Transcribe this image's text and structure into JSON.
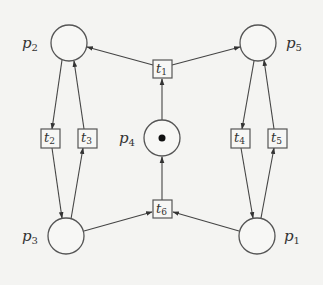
{
  "diagram": {
    "type": "petri-net",
    "places": [
      {
        "id": "p1",
        "name": "p",
        "sub": "1",
        "tokens": 0
      },
      {
        "id": "p2",
        "name": "p",
        "sub": "2",
        "tokens": 0
      },
      {
        "id": "p3",
        "name": "p",
        "sub": "3",
        "tokens": 0
      },
      {
        "id": "p4",
        "name": "p",
        "sub": "4",
        "tokens": 1
      },
      {
        "id": "p5",
        "name": "p",
        "sub": "5",
        "tokens": 0
      }
    ],
    "transitions": [
      {
        "id": "t1",
        "name": "t",
        "sub": "1"
      },
      {
        "id": "t2",
        "name": "t",
        "sub": "2"
      },
      {
        "id": "t3",
        "name": "t",
        "sub": "3"
      },
      {
        "id": "t4",
        "name": "t",
        "sub": "4"
      },
      {
        "id": "t5",
        "name": "t",
        "sub": "5"
      },
      {
        "id": "t6",
        "name": "t",
        "sub": "6"
      }
    ],
    "arcs": [
      {
        "from": "p4",
        "to": "t1"
      },
      {
        "from": "t1",
        "to": "p2"
      },
      {
        "from": "t1",
        "to": "p5"
      },
      {
        "from": "p2",
        "to": "t2"
      },
      {
        "from": "t2",
        "to": "p3"
      },
      {
        "from": "p3",
        "to": "t3"
      },
      {
        "from": "t3",
        "to": "p2"
      },
      {
        "from": "p5",
        "to": "t4"
      },
      {
        "from": "t4",
        "to": "p1"
      },
      {
        "from": "p1",
        "to": "t5"
      },
      {
        "from": "t5",
        "to": "p5"
      },
      {
        "from": "p3",
        "to": "t6"
      },
      {
        "from": "p1",
        "to": "t6"
      },
      {
        "from": "t6",
        "to": "p4"
      }
    ]
  }
}
